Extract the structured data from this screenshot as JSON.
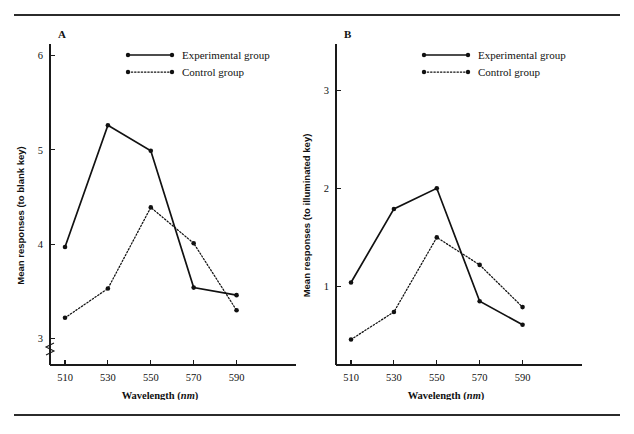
{
  "figure": {
    "background": "#ffffff",
    "ink_color": "#111111",
    "rule_color": "#2b2b2b",
    "has_top_rule": true,
    "has_bottom_rule": true
  },
  "legend": {
    "experimental_label": "Experimental group",
    "control_label": "Control group",
    "experimental_style": "solid",
    "control_style": "dotted",
    "marker": "filled-circle",
    "position": "top-center"
  },
  "chart_data": [
    {
      "type": "line",
      "panel": "A",
      "panel_label": "A",
      "title": "",
      "xlabel": "Wavelength (nm)",
      "xlabel_unit_italic": "nm",
      "ylabel": "Mean responses (to blank key)",
      "x": [
        510,
        530,
        550,
        570,
        590
      ],
      "xticks": [
        510,
        530,
        550,
        570,
        590
      ],
      "xticklabels": [
        "510",
        "530",
        "550",
        "570",
        "590"
      ],
      "yticks": [
        3,
        4,
        5,
        6
      ],
      "yticklabels": [
        "3",
        "4",
        "5",
        "6"
      ],
      "ylim": [
        2.72,
        6.1
      ],
      "xlim": [
        503,
        600
      ],
      "grid": false,
      "axis_break": true,
      "axis_break_axis": "y",
      "series": [
        {
          "name": "Experimental group",
          "style": "solid",
          "marker": "filled-circle",
          "values": [
            3.97,
            5.26,
            4.99,
            3.54,
            3.46
          ]
        },
        {
          "name": "Control group",
          "style": "dotted",
          "marker": "filled-circle",
          "values": [
            3.22,
            3.53,
            4.39,
            4.01,
            3.3
          ]
        }
      ]
    },
    {
      "type": "line",
      "panel": "B",
      "panel_label": "B",
      "title": "",
      "xlabel": "Wavelength (nm)",
      "xlabel_unit_italic": "nm",
      "ylabel": "Mean responses (to illuminated key)",
      "x": [
        510,
        530,
        550,
        570,
        590
      ],
      "xticks": [
        510,
        530,
        550,
        570,
        590
      ],
      "xticklabels": [
        "510",
        "530",
        "550",
        "570",
        "590"
      ],
      "yticks": [
        1,
        2,
        3
      ],
      "yticklabels": [
        "1",
        "2",
        "3"
      ],
      "ylim": [
        0.2,
        3.45
      ],
      "xlim": [
        503,
        600
      ],
      "grid": false,
      "axis_break": false,
      "series": [
        {
          "name": "Experimental group",
          "style": "solid",
          "marker": "filled-circle",
          "values": [
            1.04,
            1.79,
            2.0,
            0.85,
            0.61
          ]
        },
        {
          "name": "Control group",
          "style": "dotted",
          "marker": "filled-circle",
          "values": [
            0.46,
            0.74,
            1.5,
            1.22,
            0.79
          ]
        }
      ]
    }
  ]
}
